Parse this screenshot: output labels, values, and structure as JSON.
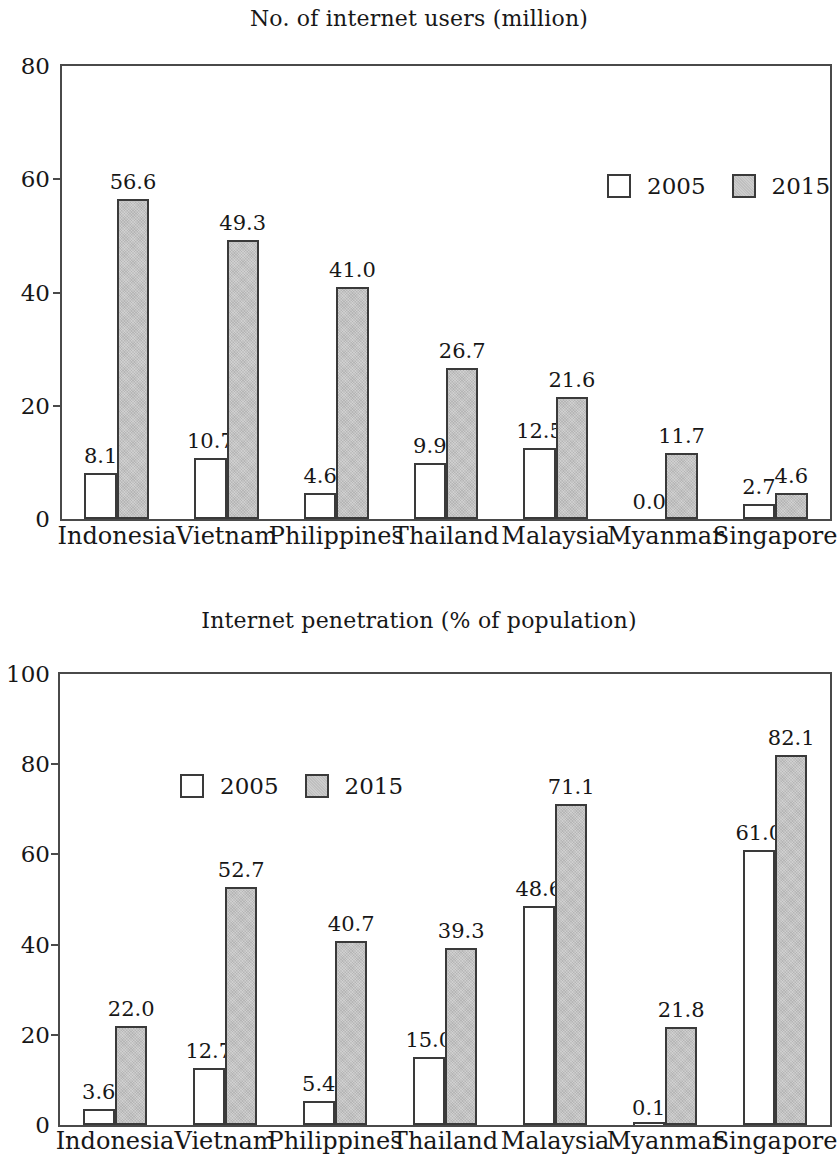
{
  "page": {
    "background": "#ffffff",
    "text_color": "#171717"
  },
  "chart_data": [
    {
      "id": "internet-users",
      "type": "bar",
      "title": "No. of internet users (million)",
      "xlabel": "",
      "ylabel": "",
      "ylim": [
        0,
        80
      ],
      "yticks": [
        0,
        20,
        40,
        60,
        80
      ],
      "grid": false,
      "legend_position": "top-right",
      "categories": [
        "Indonesia",
        "Vietnam",
        "Philippines",
        "Thailand",
        "Malaysia",
        "Myanmar",
        "Singapore"
      ],
      "series": [
        {
          "name": "2005",
          "color": "#ffffff",
          "values": [
            8.1,
            10.7,
            4.6,
            9.9,
            12.5,
            0.0,
            2.7
          ],
          "labels": [
            "8.1",
            "10.7",
            "4.6",
            "9.9",
            "12.5",
            "0.0",
            "2.7"
          ]
        },
        {
          "name": "2015",
          "color": "#cacaca",
          "values": [
            56.6,
            49.3,
            41.0,
            26.7,
            21.6,
            11.7,
            4.6
          ],
          "labels": [
            "56.6",
            "49.3",
            "41.0",
            "26.7",
            "21.6",
            "11.7",
            "4.6"
          ]
        }
      ]
    },
    {
      "id": "internet-penetration",
      "type": "bar",
      "title": "Internet penetration (% of population)",
      "xlabel": "",
      "ylabel": "",
      "ylim": [
        0,
        100
      ],
      "yticks": [
        0,
        20,
        40,
        60,
        80,
        100
      ],
      "grid": false,
      "legend_position": "top-left",
      "categories": [
        "Indonesia",
        "Vietnam",
        "Philippines",
        "Thailand",
        "Malaysia",
        "Myanmar",
        "Singapore"
      ],
      "series": [
        {
          "name": "2005",
          "color": "#ffffff",
          "values": [
            3.6,
            12.7,
            5.4,
            15.0,
            48.6,
            0.1,
            61.0
          ],
          "labels": [
            "3.6",
            "12.7",
            "5.4",
            "15.0",
            "48.6",
            "0.1",
            "61.0"
          ]
        },
        {
          "name": "2015",
          "color": "#cacaca",
          "values": [
            22.0,
            52.7,
            40.7,
            39.3,
            71.1,
            21.8,
            82.1
          ],
          "labels": [
            "22.0",
            "52.7",
            "40.7",
            "39.3",
            "71.1",
            "21.8",
            "82.1"
          ]
        }
      ]
    }
  ]
}
